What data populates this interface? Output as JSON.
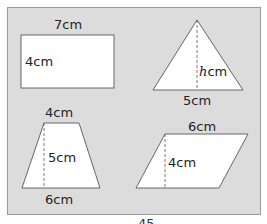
{
  "figure": {
    "rectangle": {
      "width_label": "7cm",
      "height_label": "4cm"
    },
    "triangle": {
      "height_var": "h",
      "height_unit": "cm",
      "base_label": "5cm"
    },
    "trapezoid": {
      "top_label": "4cm",
      "height_label": "5cm",
      "bottom_label": "6cm"
    },
    "parallelogram": {
      "base_label": "6cm",
      "height_label": "4cm"
    }
  },
  "page_number": "45"
}
